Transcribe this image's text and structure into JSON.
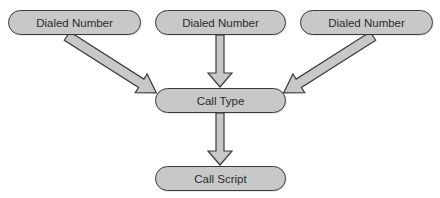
{
  "diagram": {
    "nodes": [
      {
        "id": "dn1",
        "label": "Dialed Number"
      },
      {
        "id": "dn2",
        "label": "Dialed Number"
      },
      {
        "id": "dn3",
        "label": "Dialed Number"
      },
      {
        "id": "ct",
        "label": "Call Type"
      },
      {
        "id": "cs",
        "label": "Call Script"
      }
    ],
    "edges": [
      {
        "from": "dn1",
        "to": "ct"
      },
      {
        "from": "dn2",
        "to": "ct"
      },
      {
        "from": "dn3",
        "to": "ct"
      },
      {
        "from": "ct",
        "to": "cs"
      }
    ],
    "colors": {
      "node_fill": "#c8c8c8",
      "node_stroke": "#3a3a3a",
      "arrow_fill": "#c8c8c8",
      "arrow_stroke": "#3a3a3a"
    }
  }
}
